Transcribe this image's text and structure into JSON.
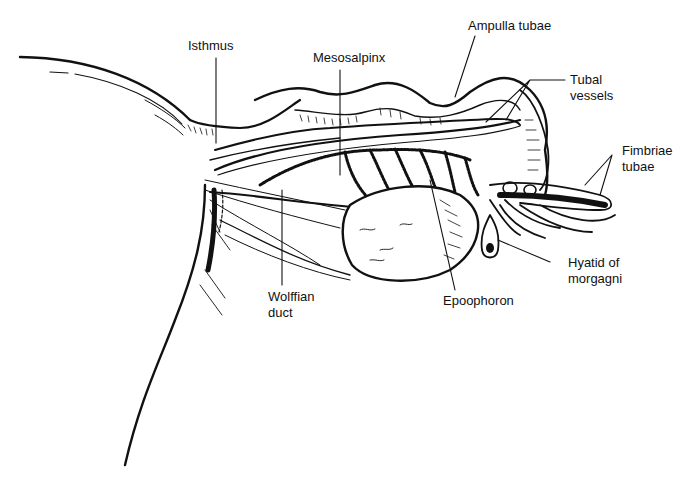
{
  "diagram": {
    "colors": {
      "ink": "#111111",
      "background": "#ffffff"
    },
    "labels": [
      {
        "id": "isthmus",
        "lines": [
          "Isthmus"
        ]
      },
      {
        "id": "mesosalpinx",
        "lines": [
          "Mesosalpinx"
        ]
      },
      {
        "id": "ampulla",
        "lines": [
          "Ampulla tubae"
        ]
      },
      {
        "id": "tubal-vessels",
        "lines": [
          "Tubal",
          "vessels"
        ]
      },
      {
        "id": "fimbriae",
        "lines": [
          "Fimbriae",
          "tubae"
        ]
      },
      {
        "id": "hyatid",
        "lines": [
          "Hyatid of",
          "morgagni"
        ]
      },
      {
        "id": "epoophoron",
        "lines": [
          "Epoophoron"
        ]
      },
      {
        "id": "wolffian",
        "lines": [
          "Wolffian",
          "duct"
        ]
      }
    ]
  }
}
